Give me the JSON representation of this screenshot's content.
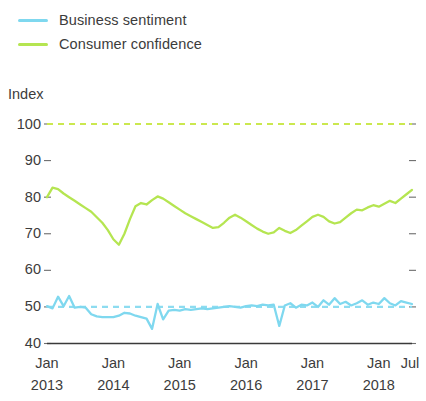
{
  "legend": {
    "position": "top-left",
    "items": [
      {
        "label": "Business sentiment",
        "color": "#7fd8ef",
        "icon": "line-swatch-icon"
      },
      {
        "label": "Consumer confidence",
        "color": "#b5e551",
        "icon": "line-swatch-icon"
      }
    ]
  },
  "axis": {
    "y_title": "Index",
    "y_ticks": [
      "100",
      "90",
      "80",
      "70",
      "60",
      "50",
      "40"
    ],
    "x_ticks": [
      {
        "month": "Jan",
        "year": "2013"
      },
      {
        "month": "Jan",
        "year": "2014"
      },
      {
        "month": "Jan",
        "year": "2015"
      },
      {
        "month": "Jan",
        "year": "2016"
      },
      {
        "month": "Jan",
        "year": "2017"
      },
      {
        "month": "Jan",
        "year": "2018"
      },
      {
        "month": "Jul",
        "year": ""
      }
    ]
  },
  "chart_data": {
    "type": "line",
    "title": "",
    "subtitle": "",
    "xlabel": "",
    "ylabel": "Index",
    "ylim": [
      40,
      100
    ],
    "yticks": [
      40,
      50,
      60,
      70,
      80,
      90,
      100
    ],
    "grid": false,
    "legend_position": "top-left",
    "x_axis_type": "monthly",
    "x_start": "2013-01",
    "x_end": "2018-07",
    "x_tick_labels": [
      "Jan 2013",
      "Jan 2014",
      "Jan 2015",
      "Jan 2016",
      "Jan 2017",
      "Jan 2018",
      "Jul"
    ],
    "reference_lines": [
      {
        "name": "Consumer confidence neutral",
        "value": 100,
        "color": "#cbe84f",
        "style": "dashed"
      },
      {
        "name": "Business sentiment neutral",
        "value": 50,
        "color": "#8ddcf0",
        "style": "dashed"
      }
    ],
    "x": [
      "2013-01",
      "2013-02",
      "2013-03",
      "2013-04",
      "2013-05",
      "2013-06",
      "2013-07",
      "2013-08",
      "2013-09",
      "2013-10",
      "2013-11",
      "2013-12",
      "2014-01",
      "2014-02",
      "2014-03",
      "2014-04",
      "2014-05",
      "2014-06",
      "2014-07",
      "2014-08",
      "2014-09",
      "2014-10",
      "2014-11",
      "2014-12",
      "2015-01",
      "2015-02",
      "2015-03",
      "2015-04",
      "2015-05",
      "2015-06",
      "2015-07",
      "2015-08",
      "2015-09",
      "2015-10",
      "2015-11",
      "2015-12",
      "2016-01",
      "2016-02",
      "2016-03",
      "2016-04",
      "2016-05",
      "2016-06",
      "2016-07",
      "2016-08",
      "2016-09",
      "2016-10",
      "2016-11",
      "2016-12",
      "2017-01",
      "2017-02",
      "2017-03",
      "2017-04",
      "2017-05",
      "2017-06",
      "2017-07",
      "2017-08",
      "2017-09",
      "2017-10",
      "2017-11",
      "2017-12",
      "2018-01",
      "2018-02",
      "2018-03",
      "2018-04",
      "2018-05",
      "2018-06",
      "2018-07"
    ],
    "series": [
      {
        "name": "Consumer confidence",
        "color": "#b5e551",
        "values": [
          80.0,
          82.6,
          82.2,
          81.0,
          80.0,
          79.0,
          78.0,
          77.0,
          76.0,
          74.5,
          73.0,
          71.0,
          68.5,
          67.0,
          70.0,
          74.0,
          77.5,
          78.4,
          78.0,
          79.2,
          80.2,
          79.6,
          78.6,
          77.6,
          76.6,
          75.6,
          74.8,
          74.0,
          73.2,
          72.4,
          71.6,
          71.8,
          73.0,
          74.4,
          75.2,
          74.4,
          73.4,
          72.4,
          71.4,
          70.6,
          70.0,
          70.4,
          71.6,
          70.8,
          70.2,
          71.0,
          72.2,
          73.4,
          74.6,
          75.2,
          74.6,
          73.4,
          72.8,
          73.2,
          74.4,
          75.6,
          76.6,
          76.4,
          77.2,
          77.8,
          77.4,
          78.2,
          79.0,
          78.4,
          79.6,
          80.8,
          82.0
        ]
      },
      {
        "name": "Business sentiment",
        "color": "#7fd8ef",
        "values": [
          50.2,
          49.6,
          52.8,
          50.2,
          53.0,
          49.8,
          50.0,
          49.8,
          48.0,
          47.4,
          47.2,
          47.2,
          47.2,
          47.6,
          48.4,
          48.2,
          47.6,
          47.2,
          46.8,
          44.0,
          50.8,
          46.6,
          49.0,
          49.2,
          49.0,
          49.4,
          49.2,
          49.4,
          49.6,
          49.4,
          49.6,
          49.8,
          50.0,
          50.2,
          50.0,
          49.8,
          50.2,
          50.4,
          50.2,
          50.6,
          50.4,
          50.6,
          44.8,
          50.4,
          51.0,
          49.8,
          50.6,
          50.4,
          51.2,
          50.0,
          51.8,
          50.6,
          52.4,
          50.8,
          51.4,
          50.4,
          51.0,
          51.8,
          50.6,
          51.2,
          50.8,
          52.4,
          51.0,
          50.4,
          51.6,
          51.2,
          50.8
        ]
      }
    ]
  }
}
